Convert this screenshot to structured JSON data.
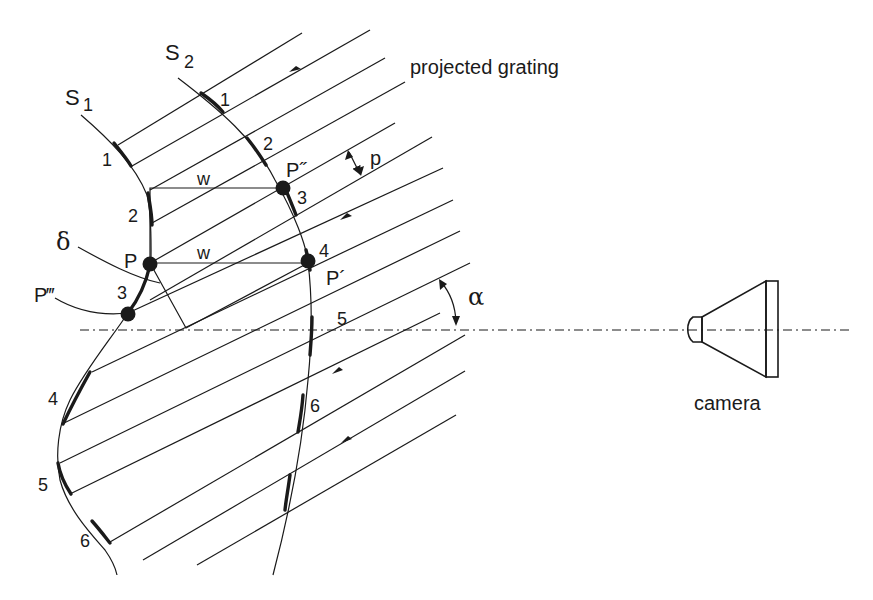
{
  "figure": {
    "type": "fringe-projection-geometry"
  },
  "labels": {
    "surface1": "S",
    "surface1_sub": "1",
    "surface2": "S",
    "surface2_sub": "2",
    "grating": "projected grating",
    "camera": "camera",
    "pitch": "p",
    "angle": "α",
    "delta": "δ",
    "width_upper": "w",
    "width_lower": "w",
    "point_P": "P",
    "point_P1": "P´",
    "point_P2": "P˝",
    "point_P3": "P‴"
  },
  "surface1_fringe_numbers": [
    "1",
    "2",
    "3",
    "4",
    "5",
    "6"
  ],
  "surface2_fringe_numbers": [
    "1",
    "2",
    "3",
    "4",
    "5",
    "6"
  ],
  "colors": {
    "ink": "#1a1a1a",
    "background": "#ffffff"
  }
}
